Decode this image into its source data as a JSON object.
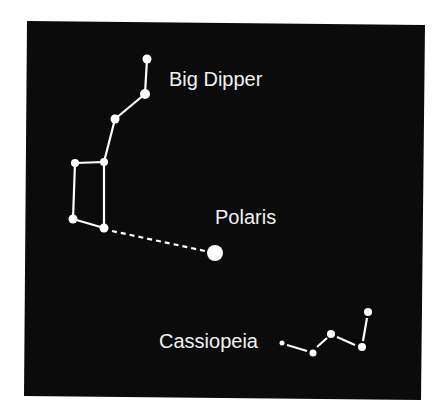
{
  "diagram": {
    "background_color": "#0b0b0b",
    "page_color": "#ffffff",
    "star_color": "#ffffff",
    "line_color": "#ffffff",
    "panel": {
      "x": 25,
      "y": 22,
      "width": 398,
      "height": 376
    }
  },
  "labels": {
    "big_dipper": "Big Dipper",
    "polaris": "Polaris",
    "cassiopeia": "Cassiopeia"
  },
  "constellations": {
    "big_dipper": {
      "name": "Big Dipper",
      "stars": [
        {
          "x": 147,
          "y": 59,
          "r": 4.5
        },
        {
          "x": 145,
          "y": 94,
          "r": 5
        },
        {
          "x": 115,
          "y": 119,
          "r": 4.5
        },
        {
          "x": 104,
          "y": 162,
          "r": 4
        },
        {
          "x": 75,
          "y": 163,
          "r": 4
        },
        {
          "x": 73,
          "y": 219,
          "r": 4.5
        },
        {
          "x": 104,
          "y": 228,
          "r": 4.5
        }
      ]
    },
    "polaris": {
      "name": "Polaris",
      "star": {
        "x": 215,
        "y": 253,
        "r": 8
      }
    },
    "cassiopeia": {
      "name": "Cassiopeia",
      "stars": [
        {
          "x": 282,
          "y": 343,
          "r": 2.5
        },
        {
          "x": 313,
          "y": 353,
          "r": 3.5
        },
        {
          "x": 331,
          "y": 334,
          "r": 4
        },
        {
          "x": 362,
          "y": 347,
          "r": 4
        },
        {
          "x": 368,
          "y": 312,
          "r": 4
        }
      ]
    }
  }
}
